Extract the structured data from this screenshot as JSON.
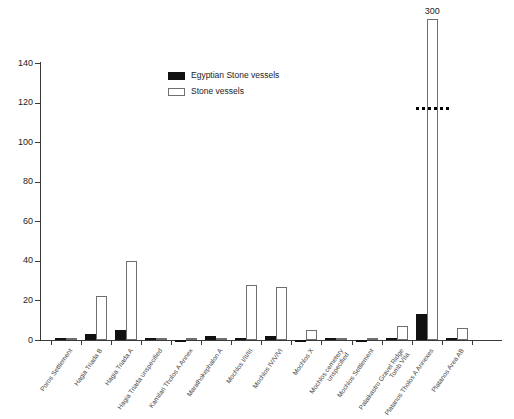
{
  "chart_data": {
    "type": "bar",
    "title": "",
    "xlabel": "",
    "ylabel": "",
    "ylim": [
      0,
      140
    ],
    "yticks": [
      0,
      20,
      40,
      60,
      80,
      100,
      120,
      140
    ],
    "grid": false,
    "legend_position": "upper-center",
    "axis_break": {
      "present": true,
      "style": "dashed",
      "note": "Stone vessels bar for Platanos Tholos A Annexes is truncated; true value annotated above bar."
    },
    "categories": [
      "Poros Settlement",
      "Hagia Triada B",
      "Hagia Triada A",
      "Hagia Triada unspecified",
      "Kamilari Tholos A Annex",
      "Marathokephalon A",
      "Mochlos I/II/III",
      "Mochlos IV/V/VI",
      "Mochlos X",
      "Mochlos cemetery unspecified",
      "Mochlos Settlement",
      "Palaikastro Gravel Ridge Tomb VIIa",
      "Platanos Tholos A Annexes",
      "Platanos Area AB"
    ],
    "category_lines": [
      [
        "Poros Settlement",
        ""
      ],
      [
        "Hagia Triada B",
        ""
      ],
      [
        "Hagia Triada A",
        ""
      ],
      [
        "Hagia Triada unspecified",
        ""
      ],
      [
        "Kamilari Tholos A Annex",
        ""
      ],
      [
        "Marathokephalon A",
        ""
      ],
      [
        "Mochlos I/II/III",
        ""
      ],
      [
        "Mochlos IV/V/VI",
        ""
      ],
      [
        "Mochlos X",
        ""
      ],
      [
        "Mochlos cemetery",
        "unspecified"
      ],
      [
        "Mochlos Settlement",
        ""
      ],
      [
        "Palaikastro Gravel Ridge",
        "Tomb VIIa"
      ],
      [
        "Platanos Tholos A Annexes",
        ""
      ],
      [
        "Platanos Area AB",
        ""
      ]
    ],
    "series": [
      {
        "name": "Egyptian Stone vessels",
        "color": "#111111",
        "values": [
          1,
          3,
          5,
          1,
          0,
          2,
          1,
          2,
          0,
          1,
          0,
          1,
          13,
          1
        ]
      },
      {
        "name": "Stone vessels",
        "color": "#ffffff",
        "values": [
          1,
          22,
          40,
          1,
          1,
          1,
          28,
          27,
          5,
          1,
          1,
          7,
          300,
          6
        ]
      }
    ],
    "annotations": [
      {
        "text": "300",
        "target_category": "Platanos Tholos A Annexes",
        "target_series": "Stone vessels"
      }
    ]
  },
  "legend": {
    "items": [
      {
        "label": "Egyptian Stone vessels",
        "swatch": "black-filled-square"
      },
      {
        "label": "Stone vessels",
        "swatch": "white-outlined-square"
      }
    ]
  },
  "axis": {
    "y_tick_labels": [
      "0",
      "20",
      "40",
      "60",
      "80",
      "100",
      "120",
      "140"
    ]
  }
}
